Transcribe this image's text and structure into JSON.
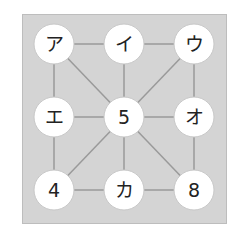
{
  "nodes": [
    {
      "id": "a",
      "label": "ア",
      "row": 0,
      "col": 0
    },
    {
      "id": "i",
      "label": "イ",
      "row": 0,
      "col": 1
    },
    {
      "id": "u",
      "label": "ウ",
      "row": 0,
      "col": 2
    },
    {
      "id": "e",
      "label": "エ",
      "row": 1,
      "col": 0
    },
    {
      "id": "c5",
      "label": "5",
      "row": 1,
      "col": 1
    },
    {
      "id": "o",
      "label": "オ",
      "row": 1,
      "col": 2
    },
    {
      "id": "c4",
      "label": "4",
      "row": 2,
      "col": 0
    },
    {
      "id": "ka",
      "label": "カ",
      "row": 2,
      "col": 1
    },
    {
      "id": "c8",
      "label": "8",
      "row": 2,
      "col": 2
    }
  ],
  "edges": [
    [
      "a",
      "i"
    ],
    [
      "i",
      "u"
    ],
    [
      "a",
      "e"
    ],
    [
      "a",
      "c5"
    ],
    [
      "i",
      "c5"
    ],
    [
      "u",
      "c5"
    ],
    [
      "u",
      "o"
    ],
    [
      "e",
      "c5"
    ],
    [
      "c5",
      "o"
    ],
    [
      "e",
      "c4"
    ],
    [
      "c5",
      "c4"
    ],
    [
      "c5",
      "ka"
    ],
    [
      "c5",
      "c8"
    ],
    [
      "o",
      "c8"
    ],
    [
      "c4",
      "ka"
    ],
    [
      "ka",
      "c8"
    ]
  ],
  "colors": {
    "board": "#d4d4d4",
    "edge": "#9a9a9a",
    "node_fill": "#ffffff"
  }
}
